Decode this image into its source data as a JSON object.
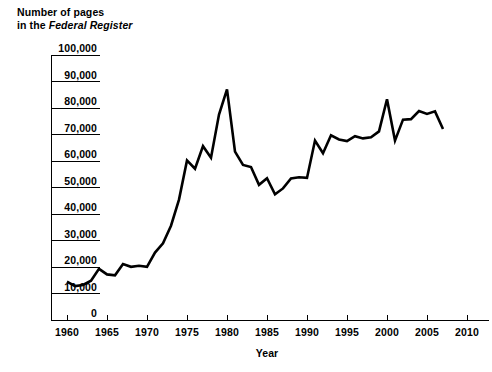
{
  "chart_data": {
    "type": "line",
    "title": "Number of pages in the Federal Register",
    "title_line1": "Number of pages",
    "title_line2_prefix": "in the ",
    "title_line2_italic": "Federal Register",
    "xlabel": "Year",
    "ylabel": "",
    "xlim": [
      1960,
      2010
    ],
    "ylim": [
      0,
      100000
    ],
    "grid": false,
    "legend": null,
    "line_color": "#000000",
    "x_ticks": [
      1960,
      1965,
      1970,
      1975,
      1980,
      1985,
      1990,
      1995,
      2000,
      2005,
      2010
    ],
    "x_tick_labels": [
      "1960",
      "1965",
      "1970",
      "1975",
      "1980",
      "1985",
      "1990",
      "1995",
      "2000",
      "2005",
      "2010"
    ],
    "y_ticks": [
      0,
      10000,
      20000,
      30000,
      40000,
      50000,
      60000,
      70000,
      80000,
      90000,
      100000
    ],
    "y_tick_labels": [
      "0",
      "10,000",
      "20,000",
      "30,000",
      "40,000",
      "50,000",
      "60,000",
      "70,000",
      "80,000",
      "90,000",
      "100,000"
    ],
    "x": [
      1960,
      1961,
      1962,
      1963,
      1964,
      1965,
      1966,
      1967,
      1968,
      1969,
      1970,
      1971,
      1972,
      1973,
      1974,
      1975,
      1976,
      1977,
      1978,
      1979,
      1980,
      1981,
      1982,
      1983,
      1984,
      1985,
      1986,
      1987,
      1988,
      1989,
      1990,
      1991,
      1992,
      1993,
      1994,
      1995,
      1996,
      1997,
      1998,
      1999,
      2000,
      2001,
      2002,
      2003,
      2004,
      2005,
      2006,
      2007
    ],
    "values": [
      14479,
      12792,
      13226,
      14842,
      19304,
      17206,
      16850,
      21088,
      20068,
      20466,
      20036,
      25442,
      28924,
      35586,
      45422,
      60221,
      57072,
      65603,
      61261,
      77498,
      87012,
      63554,
      58494,
      57704,
      50998,
      53480,
      47418,
      49654,
      53376,
      53842,
      53620,
      67716,
      62928,
      69684,
      68108,
      67518,
      69368,
      68530,
      68989,
      71161,
      83294,
      67702,
      75606,
      75795,
      78851,
      77752,
      78724,
      72090
    ]
  }
}
